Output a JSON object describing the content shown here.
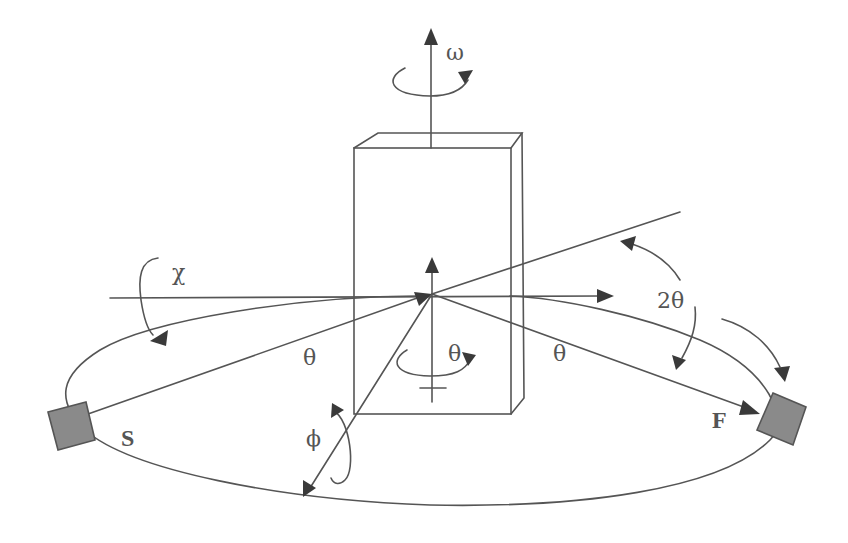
{
  "diagram": {
    "labels": {
      "omega": "ω",
      "chi": "χ",
      "phi": "ϕ",
      "theta_left": "θ",
      "theta_center": "θ",
      "theta_right": "θ",
      "two_theta": "2θ",
      "source": "S",
      "detector": "F"
    },
    "components": [
      {
        "name": "source",
        "label": "S",
        "description": "X-ray source block (grey square)"
      },
      {
        "name": "detector",
        "label": "F",
        "description": "Detector block (grey square)"
      },
      {
        "name": "crystal",
        "description": "Rectangular sample/crystal prism at center"
      },
      {
        "name": "circle",
        "description": "Elliptical diffractometer circle"
      }
    ],
    "axes": [
      {
        "name": "omega-axis",
        "label": "ω",
        "direction": "vertical up"
      },
      {
        "name": "chi-axis",
        "label": "χ",
        "direction": "horizontal"
      },
      {
        "name": "phi-axis",
        "label": "ϕ",
        "direction": "diagonal down-left"
      },
      {
        "name": "theta-axis",
        "label": "θ",
        "direction": "vertical (inner)"
      }
    ],
    "colors": {
      "line": "#555555",
      "arrowhead": "#3a3a3a",
      "block_fill": "#8a8a8a",
      "background": "#ffffff"
    }
  }
}
